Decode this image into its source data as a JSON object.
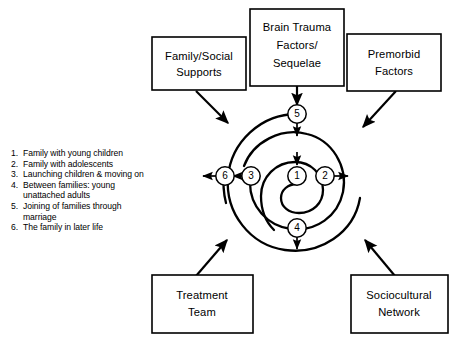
{
  "diagram": {
    "type": "spiral-influence-diagram",
    "colors": {
      "stroke": "#000000",
      "fill": "#ffffff",
      "text": "#000000"
    }
  },
  "boxes": [
    {
      "id": "family-social-supports",
      "lines": [
        "Family/Social",
        "Supports"
      ],
      "position": "top-left"
    },
    {
      "id": "brain-trauma-factors",
      "lines": [
        "Brain Trauma",
        "Factors/",
        "Sequelae"
      ],
      "position": "top-center"
    },
    {
      "id": "premorbid-factors",
      "lines": [
        "Premorbid",
        "Factors"
      ],
      "position": "top-right"
    },
    {
      "id": "treatment-team",
      "lines": [
        "Treatment",
        "Team"
      ],
      "position": "bottom-left"
    },
    {
      "id": "sociocultural-network",
      "lines": [
        "Sociocultural",
        "Network"
      ],
      "position": "bottom-right"
    }
  ],
  "spiral_nodes": [
    {
      "id": "node-1",
      "label": "1"
    },
    {
      "id": "node-2",
      "label": "2"
    },
    {
      "id": "node-3",
      "label": "3"
    },
    {
      "id": "node-4",
      "label": "4"
    },
    {
      "id": "node-5",
      "label": "5"
    },
    {
      "id": "node-6",
      "label": "6"
    }
  ],
  "legend": {
    "items": [
      {
        "num": "1.",
        "text": "Family with young children"
      },
      {
        "num": "2.",
        "text": "Family with adolescents"
      },
      {
        "num": "3.",
        "text": "Launching children & moving on"
      },
      {
        "num": "4.",
        "text": "Between families: young unattached adults"
      },
      {
        "num": "5.",
        "text": "Joining of families through marriage"
      },
      {
        "num": "6.",
        "text": "The family in later life"
      }
    ]
  }
}
